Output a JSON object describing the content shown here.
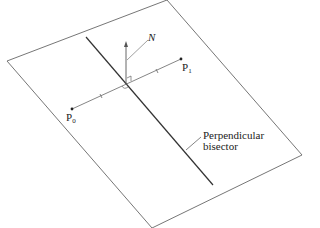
{
  "diagram": {
    "labels": {
      "normal": "N",
      "p1_main": "P",
      "p1_sub": "1",
      "p0_main": "P",
      "p0_sub": "0",
      "bisector_line1": "Perpendicular",
      "bisector_line2": "bisector"
    },
    "colors": {
      "stroke": "#555555",
      "bisector": "#333333",
      "text": "#222222",
      "background": "#ffffff"
    }
  }
}
